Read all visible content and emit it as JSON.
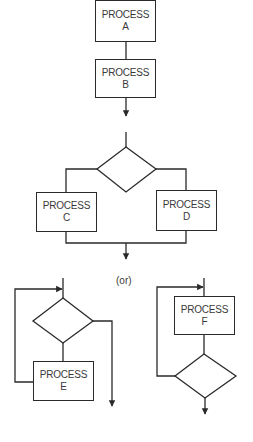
{
  "diagram": {
    "sequence": {
      "boxes": [
        {
          "line1": "PROCESS",
          "line2": "A"
        },
        {
          "line1": "PROCESS",
          "line2": "B"
        }
      ]
    },
    "selection": {
      "boxes": [
        {
          "line1": "PROCESS",
          "line2": "C"
        },
        {
          "line1": "PROCESS",
          "line2": "D"
        }
      ]
    },
    "separator": "(or)",
    "loops": {
      "while_loop": {
        "line1": "PROCESS",
        "line2": "E"
      },
      "until_loop": {
        "line1": "PROCESS",
        "line2": "F"
      }
    },
    "colors": {
      "stroke": "#2a2a2a",
      "text": "#3a3a3a",
      "background": "#ffffff"
    }
  }
}
